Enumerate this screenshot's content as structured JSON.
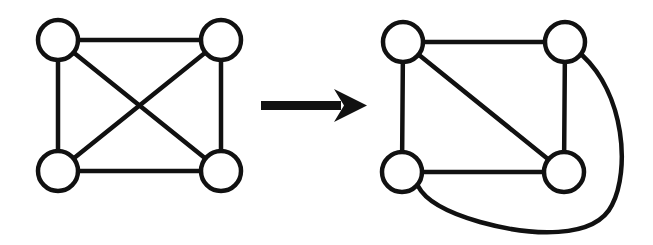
{
  "diagram": {
    "colors": {
      "stroke": "#111111",
      "background": "#ffffff",
      "node_fill": "#ffffff"
    },
    "left_graph": {
      "name": "K4 with crossing",
      "nodes": [
        "A",
        "B",
        "C",
        "D"
      ],
      "edges": [
        [
          "A",
          "B"
        ],
        [
          "A",
          "C"
        ],
        [
          "B",
          "D"
        ],
        [
          "C",
          "D"
        ],
        [
          "A",
          "D"
        ],
        [
          "B",
          "C"
        ]
      ],
      "crossing_edges": [
        [
          "A",
          "D"
        ],
        [
          "B",
          "C"
        ]
      ]
    },
    "arrow": {
      "direction": "right",
      "meaning": "transforms to"
    },
    "right_graph": {
      "name": "K4 planar embedding",
      "nodes": [
        "A",
        "B",
        "C",
        "D"
      ],
      "edges": [
        [
          "A",
          "B"
        ],
        [
          "A",
          "C"
        ],
        [
          "B",
          "D"
        ],
        [
          "C",
          "D"
        ],
        [
          "A",
          "D"
        ],
        [
          "B",
          "C"
        ]
      ],
      "curved_edges": [
        [
          "B",
          "C"
        ]
      ]
    }
  }
}
